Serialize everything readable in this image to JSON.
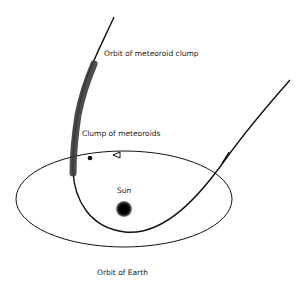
{
  "diagram": {
    "type": "orbital-diagram",
    "labels": {
      "meteoroid_orbit": "Orbit of meteoroid clump",
      "clump": "Clump of meteoroids",
      "sun": "Sun",
      "earth_orbit": "Orbit of Earth"
    },
    "colors": {
      "background": "#ffffff",
      "line": "#111111",
      "clump": "#3a3a3a",
      "sun": "#111111"
    }
  }
}
